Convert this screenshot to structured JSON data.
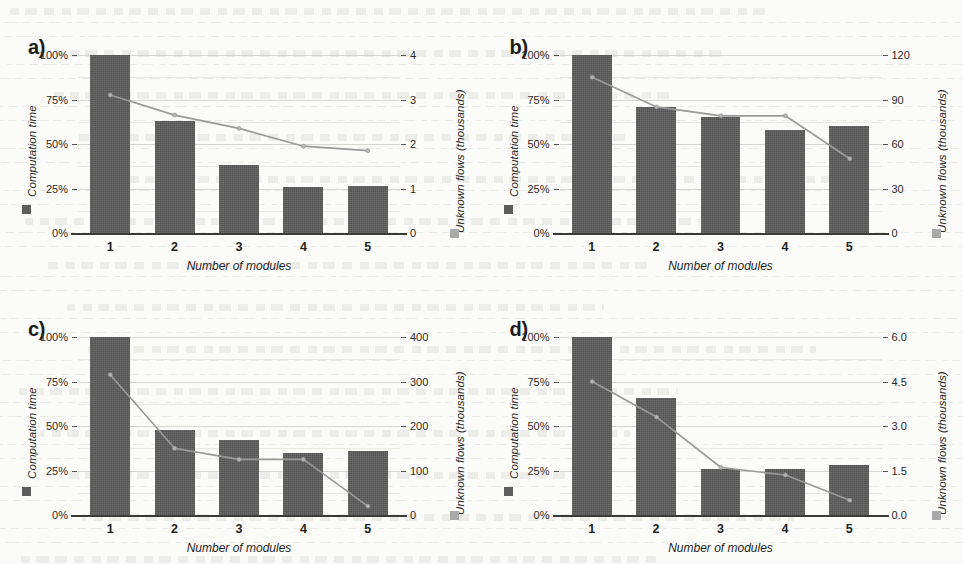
{
  "figure": {
    "background_color": "#fbfbf9",
    "bar_color": "#5c5c5c",
    "line_color": "#9a9a9a",
    "grid_color": "#cfcfc9",
    "axis_color": "#3a3a36",
    "shared": {
      "xlabel": "Number of modules",
      "x_categories": [
        "1",
        "2",
        "3",
        "4",
        "5"
      ],
      "left_axis_title": "Computation time",
      "right_axis_title": "Unknown flows (thousands)",
      "left_ticks": [
        "0%",
        "25%",
        "50%",
        "75%",
        "100%"
      ],
      "legend_bar_icon": "dark-square-icon",
      "legend_line_icon": "light-square-icon"
    },
    "panels": [
      {
        "id": "a",
        "label": "a)"
      },
      {
        "id": "b",
        "label": "b)"
      },
      {
        "id": "c",
        "label": "c)"
      },
      {
        "id": "d",
        "label": "d)"
      }
    ]
  },
  "chart_data": [
    {
      "id": "a",
      "panel_label": "a)",
      "type": "bar",
      "title": "",
      "xlabel": "Number of modules",
      "ylabel": "Computation time",
      "y2label": "Unknown flows (thousands)",
      "categories": [
        "1",
        "2",
        "3",
        "4",
        "5"
      ],
      "grid": true,
      "ylim": [
        0,
        100
      ],
      "ytick_labels": [
        "0%",
        "25%",
        "50%",
        "75%",
        "100%"
      ],
      "ytick_values": [
        0,
        25,
        50,
        75,
        100
      ],
      "y2lim": [
        0,
        4
      ],
      "y2tick_labels": [
        "0",
        "1",
        "2",
        "3",
        "4"
      ],
      "y2tick_values": [
        0,
        1,
        2,
        3,
        4
      ],
      "series": [
        {
          "name": "Computation time",
          "kind": "bar",
          "axis": "left",
          "values": [
            100,
            63,
            38,
            26,
            26.5
          ]
        },
        {
          "name": "Unknown flows",
          "kind": "line",
          "axis": "right",
          "values": [
            3.1,
            2.65,
            2.35,
            1.95,
            1.85
          ]
        }
      ]
    },
    {
      "id": "b",
      "panel_label": "b)",
      "type": "bar",
      "title": "",
      "xlabel": "Number of modules",
      "ylabel": "Computation time",
      "y2label": "Unknown flows (thousands)",
      "categories": [
        "1",
        "2",
        "3",
        "4",
        "5"
      ],
      "grid": true,
      "ylim": [
        0,
        100
      ],
      "ytick_labels": [
        "0%",
        "25%",
        "50%",
        "75%",
        "100%"
      ],
      "ytick_values": [
        0,
        25,
        50,
        75,
        100
      ],
      "y2lim": [
        0,
        120
      ],
      "y2tick_labels": [
        "0",
        "30",
        "60",
        "90",
        "120"
      ],
      "y2tick_values": [
        0,
        30,
        60,
        90,
        120
      ],
      "series": [
        {
          "name": "Computation time",
          "kind": "bar",
          "axis": "left",
          "values": [
            100,
            71,
            65,
            58,
            60
          ]
        },
        {
          "name": "Unknown flows",
          "kind": "line",
          "axis": "right",
          "values": [
            105,
            85,
            79,
            79,
            50
          ]
        }
      ]
    },
    {
      "id": "c",
      "panel_label": "c)",
      "type": "bar",
      "title": "",
      "xlabel": "Number of modules",
      "ylabel": "Computation time",
      "y2label": "Unknown flows (thousands)",
      "categories": [
        "1",
        "2",
        "3",
        "4",
        "5"
      ],
      "grid": true,
      "ylim": [
        0,
        100
      ],
      "ytick_labels": [
        "0%",
        "25%",
        "50%",
        "75%",
        "100%"
      ],
      "ytick_values": [
        0,
        25,
        50,
        75,
        100
      ],
      "y2lim": [
        0,
        400
      ],
      "y2tick_labels": [
        "0",
        "100",
        "200",
        "300",
        "400"
      ],
      "y2tick_values": [
        0,
        100,
        200,
        300,
        400
      ],
      "series": [
        {
          "name": "Computation time",
          "kind": "bar",
          "axis": "left",
          "values": [
            100,
            48,
            42,
            35,
            36
          ]
        },
        {
          "name": "Unknown flows",
          "kind": "line",
          "axis": "right",
          "values": [
            315,
            150,
            125,
            125,
            20
          ]
        }
      ]
    },
    {
      "id": "d",
      "panel_label": "d)",
      "type": "bar",
      "title": "",
      "xlabel": "Number of modules",
      "ylabel": "Computation time",
      "y2label": "Unknown flows (thousands)",
      "categories": [
        "1",
        "2",
        "3",
        "4",
        "5"
      ],
      "grid": true,
      "ylim": [
        0,
        100
      ],
      "ytick_labels": [
        "0%",
        "25%",
        "50%",
        "75%",
        "100%"
      ],
      "ytick_values": [
        0,
        25,
        50,
        75,
        100
      ],
      "y2lim": [
        0,
        6
      ],
      "y2tick_labels": [
        "0.0",
        "1.5",
        "3.0",
        "4.5",
        "6.0"
      ],
      "y2tick_values": [
        0,
        1.5,
        3.0,
        4.5,
        6.0
      ],
      "series": [
        {
          "name": "Computation time",
          "kind": "bar",
          "axis": "left",
          "values": [
            100,
            66,
            26,
            26,
            28
          ]
        },
        {
          "name": "Unknown flows",
          "kind": "line",
          "axis": "right",
          "values": [
            4.5,
            3.3,
            1.6,
            1.35,
            0.5
          ]
        }
      ]
    }
  ]
}
